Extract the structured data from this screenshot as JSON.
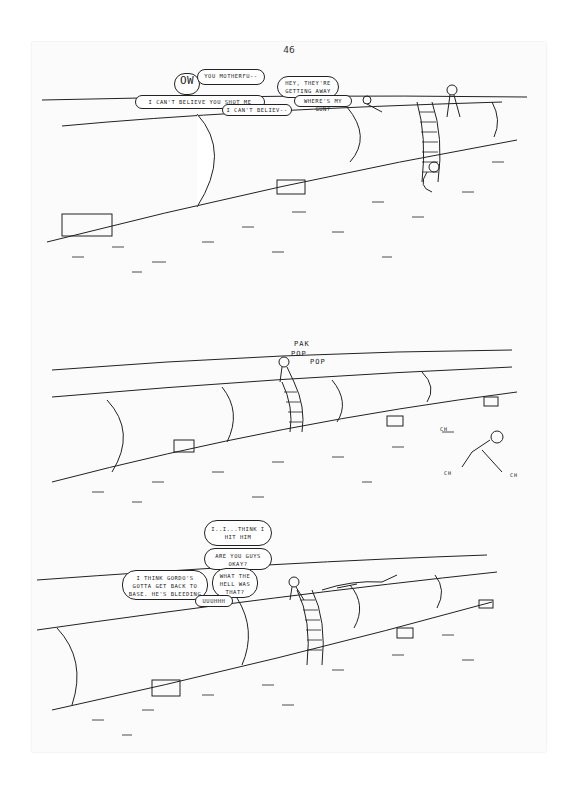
{
  "page": {
    "number": "46",
    "background": "#ffffff",
    "paper": "#fbfbfb",
    "ink": "#222222"
  },
  "panels": [
    {
      "id": "panel-1",
      "description": "Pipeline in desert; soldiers on ladder; wounded men on ground",
      "bubbles": [
        {
          "text": "OW",
          "emphasis": true
        },
        {
          "text": "YOU MOTHERFU--"
        },
        {
          "text": "HEY, THEY'RE\nGETTING AWAY"
        },
        {
          "text": "I CAN'T BELIEVE YOU SHOT ME"
        },
        {
          "text": "I CAN'T BELIEV--"
        },
        {
          "text": "WHERE'S MY GUN?"
        }
      ]
    },
    {
      "id": "panel-2",
      "description": "Soldier atop pipeline firing at running figure",
      "sfx": [
        {
          "text": "PAK"
        },
        {
          "text": "POP"
        },
        {
          "text": "POP"
        },
        {
          "text": "CH"
        },
        {
          "text": "CH"
        },
        {
          "text": "CH"
        }
      ]
    },
    {
      "id": "panel-3",
      "description": "Soldier on ladder atop pipeline; conversation",
      "bubbles": [
        {
          "text": "I..I...THINK I\nHIT HIM"
        },
        {
          "text": "ARE YOU GUYS\nOKAY?"
        },
        {
          "text": "I THINK GORDO'S\nGOTTA GET BACK TO\nBASE. HE'S BLEEDING"
        },
        {
          "text": "WHAT THE\nHELL WAS\nTHAT?"
        },
        {
          "text": "UUUHHH"
        }
      ]
    }
  ]
}
